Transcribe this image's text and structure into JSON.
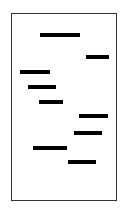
{
  "diagram": {
    "frame": {
      "x": 11,
      "y": 13,
      "width": 106,
      "height": 188,
      "border_color": "#333333"
    },
    "bar_color": "#000000",
    "bars": [
      {
        "x": 40,
        "y": 33,
        "width": 40
      },
      {
        "x": 86,
        "y": 55,
        "width": 23
      },
      {
        "x": 20,
        "y": 70,
        "width": 30
      },
      {
        "x": 28,
        "y": 85,
        "width": 28
      },
      {
        "x": 39,
        "y": 100,
        "width": 24
      },
      {
        "x": 79,
        "y": 114,
        "width": 29
      },
      {
        "x": 74,
        "y": 131,
        "width": 28
      },
      {
        "x": 33,
        "y": 146,
        "width": 34
      },
      {
        "x": 68,
        "y": 160,
        "width": 28
      }
    ]
  }
}
